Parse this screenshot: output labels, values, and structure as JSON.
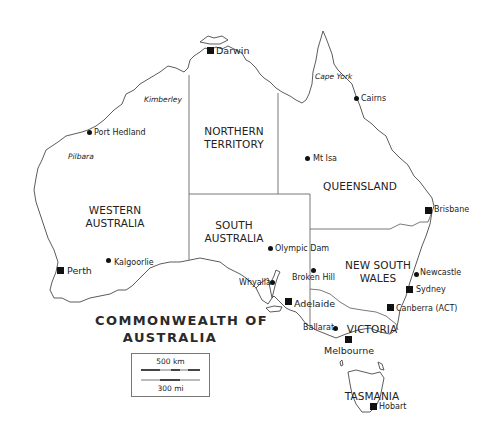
{
  "map": {
    "title_line1": "COMMONWEALTH OF",
    "title_line2": "AUSTRALIA",
    "states": {
      "wa": [
        "WESTERN",
        "AUSTRALIA"
      ],
      "nt": [
        "NORTHERN",
        "TERRITORY"
      ],
      "sa": [
        "SOUTH",
        "AUSTRALIA"
      ],
      "qld": [
        "QUEENSLAND"
      ],
      "nsw": [
        "NEW SOUTH",
        "WALES"
      ],
      "vic": [
        "VICTORIA"
      ],
      "tas": [
        "TASMANIA"
      ]
    },
    "regions": {
      "kimberley": "Kimberley",
      "pilbara": "Pilbara",
      "cape_york": "Cape York"
    },
    "capitals": {
      "darwin": "Darwin",
      "perth": "Perth",
      "adelaide": "Adelaide",
      "brisbane": "Brisbane",
      "sydney": "Sydney",
      "canberra": "Canberra (ACT)",
      "melbourne": "Melbourne",
      "hobart": "Hobart"
    },
    "towns": {
      "port_hedland": "Port Hedland",
      "kalgoorlie": "Kalgoorlie",
      "cairns": "Cairns",
      "mt_isa": "Mt Isa",
      "olympic_dam": "Olympic Dam",
      "broken_hill": "Broken Hill",
      "whyalla": "Whyalla",
      "newcastle": "Newcastle",
      "ballarat": "Ballarat"
    },
    "scale": {
      "km": "500 km",
      "mi": "300 mi"
    },
    "legend": {
      "capital_marker": "square",
      "town_marker": "dot"
    },
    "colors": {
      "land": "#ffffff",
      "coast": "#4a4a4a",
      "border": "#6a6a6a",
      "text": "#222222"
    }
  }
}
